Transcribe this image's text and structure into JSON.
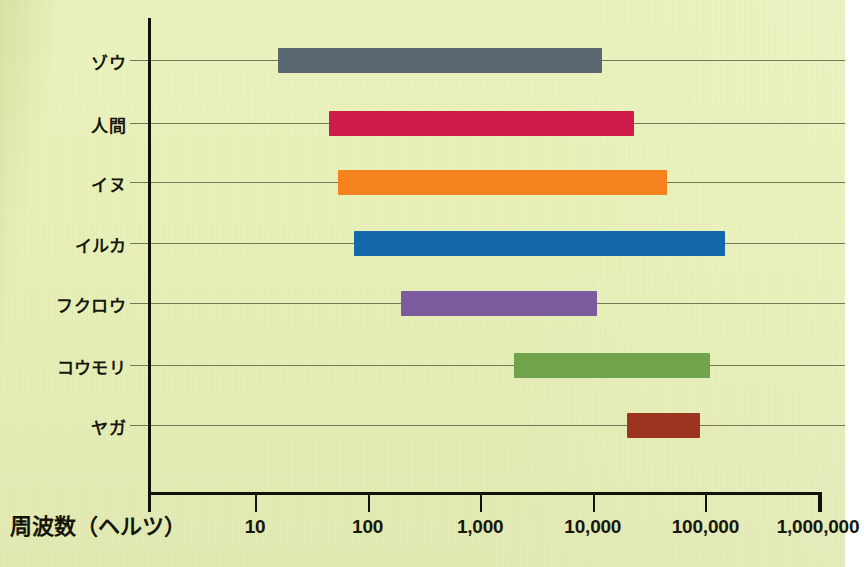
{
  "chart_data": {
    "type": "bar",
    "orientation": "horizontal",
    "subtype": "range-bar",
    "title": "",
    "xlabel": "周波数（ヘルツ）",
    "ylabel": "",
    "xscale": "log",
    "xlim": [
      6,
      2000000
    ],
    "grid": true,
    "legend": "none",
    "xticks": [
      {
        "value": 10,
        "label": "10"
      },
      {
        "value": 100,
        "label": "100"
      },
      {
        "value": 1000,
        "label": "1,000"
      },
      {
        "value": 10000,
        "label": "10,000"
      },
      {
        "value": 100000,
        "label": "100,000"
      },
      {
        "value": 1000000,
        "label": "1,000,000"
      }
    ],
    "categories": [
      "ゾウ",
      "人間",
      "イヌ",
      "イルカ",
      "フクロウ",
      "コウモリ",
      "ヤガ"
    ],
    "bars": [
      {
        "category": "ゾウ",
        "low": 16,
        "high": 12000,
        "color": "#5b6770"
      },
      {
        "category": "人間",
        "low": 45,
        "high": 23000,
        "color": "#cf1b4a"
      },
      {
        "category": "イヌ",
        "low": 55,
        "high": 46000,
        "color": "#f6821f"
      },
      {
        "category": "イルカ",
        "low": 75,
        "high": 150000,
        "color": "#1368ac"
      },
      {
        "category": "フクロウ",
        "low": 200,
        "high": 11000,
        "color": "#7b5a9e"
      },
      {
        "category": "コウモリ",
        "low": 2000,
        "high": 110000,
        "color": "#6fa34c"
      },
      {
        "category": "ヤガ",
        "low": 20000,
        "high": 90000,
        "color": "#9c3520"
      }
    ]
  },
  "axis": {
    "x_title": "周波数（ヘルツ）"
  },
  "colors": {
    "background": "#e9f1b9",
    "axis": "#111108",
    "gridline": "#5e6344",
    "text": "#17170c"
  }
}
